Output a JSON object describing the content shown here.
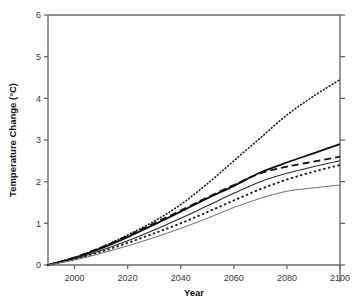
{
  "chart_data": {
    "type": "line",
    "title": "",
    "xlabel": "Year",
    "ylabel": "Temperature Change (°C)",
    "xlim": [
      1990,
      2100
    ],
    "ylim": [
      0,
      6
    ],
    "xticks": [
      2000,
      2020,
      2040,
      2060,
      2080,
      2100
    ],
    "xtick_labels": [
      "2000",
      "2020",
      "2040",
      "2060",
      "2080",
      "2100"
    ],
    "yticks": [
      0,
      1,
      2,
      3,
      4,
      5,
      6
    ],
    "ytick_labels": [
      "0",
      "1",
      "2",
      "3",
      "4",
      "5",
      "6"
    ],
    "grid": false,
    "legend": "none",
    "x": [
      1990,
      2000,
      2010,
      2020,
      2030,
      2040,
      2050,
      2060,
      2070,
      2080,
      2090,
      2100
    ],
    "series": [
      {
        "name": "highest-scenario",
        "style": "fine-dotted",
        "color": "#1a1a1a",
        "width": 1.6,
        "values": [
          0.0,
          0.18,
          0.42,
          0.72,
          1.05,
          1.45,
          1.95,
          2.5,
          3.05,
          3.6,
          4.05,
          4.45
        ]
      },
      {
        "name": "upper-solid-bold",
        "style": "solid",
        "color": "#111111",
        "width": 1.8,
        "values": [
          0.0,
          0.17,
          0.4,
          0.67,
          0.97,
          1.28,
          1.6,
          1.9,
          2.22,
          2.46,
          2.68,
          2.9
        ]
      },
      {
        "name": "dashed-scenario",
        "style": "dashed",
        "color": "#111111",
        "width": 1.8,
        "values": [
          0.0,
          0.18,
          0.42,
          0.7,
          1.0,
          1.31,
          1.62,
          1.92,
          2.2,
          2.36,
          2.48,
          2.6
        ]
      },
      {
        "name": "middle-solid-thin",
        "style": "solid",
        "color": "#2a2a2a",
        "width": 1.1,
        "values": [
          0.0,
          0.15,
          0.35,
          0.58,
          0.84,
          1.12,
          1.42,
          1.72,
          2.0,
          2.2,
          2.36,
          2.5
        ]
      },
      {
        "name": "coarse-dotted-scenario",
        "style": "coarse-dotted",
        "color": "#1a1a1a",
        "width": 2.0,
        "values": [
          0.0,
          0.14,
          0.32,
          0.53,
          0.76,
          1.0,
          1.27,
          1.55,
          1.82,
          2.05,
          2.24,
          2.4
        ]
      },
      {
        "name": "lowest-scenario",
        "style": "solid-gray",
        "color": "#6e6e6e",
        "width": 1.0,
        "values": [
          0.0,
          0.12,
          0.28,
          0.46,
          0.66,
          0.88,
          1.12,
          1.38,
          1.6,
          1.77,
          1.85,
          1.92
        ]
      }
    ]
  }
}
